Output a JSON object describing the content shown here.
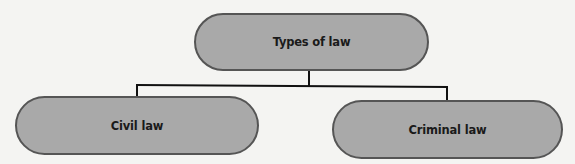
{
  "diagram": {
    "type": "tree",
    "colors": {
      "background": "#f4f4f2",
      "node_fill": "#a9a9a9",
      "node_border": "#555555",
      "connector": "#111111",
      "text": "#1a1a1a"
    },
    "root": {
      "label": "Types of law"
    },
    "children": [
      {
        "label": "Civil law"
      },
      {
        "label": "Criminal law"
      }
    ]
  }
}
